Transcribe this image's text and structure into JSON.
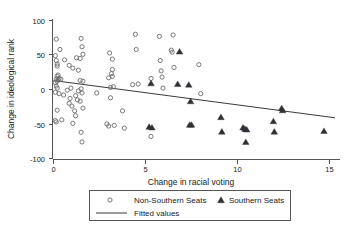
{
  "chart_data": {
    "type": "scatter",
    "title": "",
    "xlabel": "Change in racial voting",
    "ylabel": "Change in ideological rank",
    "xlim": [
      -0.6,
      15.6
    ],
    "ylim": [
      -100,
      100
    ],
    "xticks": [
      0,
      5,
      10,
      15
    ],
    "xticklabels": [
      "0",
      "5",
      "10",
      "15"
    ],
    "yticks": [
      -100,
      -50,
      0,
      50,
      100
    ],
    "yticklabels": [
      "-100",
      "-50",
      "0",
      "50",
      "100"
    ],
    "grid": false,
    "legend_position": "below-axes",
    "series": [
      {
        "name": "Non-Southern Seats",
        "marker": "open-circle",
        "color": "#6b6b6b",
        "points": [
          [
            0.15,
            73
          ],
          [
            0.1,
            49
          ],
          [
            0.35,
            58
          ],
          [
            0.15,
            42
          ],
          [
            0.2,
            37
          ],
          [
            0.2,
            34
          ],
          [
            0.6,
            43
          ],
          [
            0.25,
            21
          ],
          [
            0.2,
            19
          ],
          [
            0.3,
            16
          ],
          [
            0.15,
            15
          ],
          [
            0.25,
            14
          ],
          [
            0.2,
            12
          ],
          [
            0.4,
            15
          ],
          [
            0.1,
            10
          ],
          [
            0.15,
            5
          ],
          [
            0.2,
            2
          ],
          [
            0.1,
            -4
          ],
          [
            0.3,
            -6
          ],
          [
            0.55,
            -8
          ],
          [
            0.2,
            -30
          ],
          [
            0.1,
            -45
          ],
          [
            0.15,
            -47
          ],
          [
            0.45,
            -44
          ],
          [
            0.9,
            -13
          ],
          [
            0.85,
            -20
          ],
          [
            1.0,
            -24
          ],
          [
            1.15,
            -31
          ],
          [
            1.2,
            -38
          ],
          [
            1.05,
            -49
          ],
          [
            1.5,
            -62
          ],
          [
            1.55,
            -76
          ],
          [
            1.5,
            74
          ],
          [
            1.45,
            45
          ],
          [
            1.25,
            46
          ],
          [
            1.55,
            62
          ],
          [
            1.6,
            51
          ],
          [
            1.35,
            28
          ],
          [
            1.45,
            13
          ],
          [
            1.6,
            12
          ],
          [
            1.5,
            1
          ],
          [
            1.35,
            -2
          ],
          [
            1.55,
            -5
          ],
          [
            1.2,
            -9
          ],
          [
            1.3,
            -15
          ],
          [
            1.45,
            -17
          ],
          [
            1.6,
            -27
          ],
          [
            0.95,
            2
          ],
          [
            0.75,
            -1
          ],
          [
            0.85,
            35
          ],
          [
            1.05,
            31
          ],
          [
            2.35,
            -5
          ],
          [
            3.05,
            53
          ],
          [
            3.2,
            44
          ],
          [
            3.15,
            23
          ],
          [
            3.2,
            19
          ],
          [
            3.0,
            17
          ],
          [
            3.2,
            29
          ],
          [
            3.1,
            3
          ],
          [
            3.25,
            4
          ],
          [
            3.1,
            -12
          ],
          [
            3.0,
            -53
          ],
          [
            3.3,
            -52
          ],
          [
            3.75,
            -31
          ],
          [
            3.85,
            -56
          ],
          [
            4.45,
            80
          ],
          [
            4.5,
            58
          ],
          [
            4.3,
            7
          ],
          [
            4.6,
            8
          ],
          [
            5.3,
            16
          ],
          [
            5.3,
            -68
          ],
          [
            5.75,
            77
          ],
          [
            5.8,
            42
          ],
          [
            5.85,
            27
          ],
          [
            5.9,
            18
          ],
          [
            5.95,
            2
          ],
          [
            6.5,
            79
          ],
          [
            6.4,
            57
          ],
          [
            6.45,
            54
          ],
          [
            6.55,
            32
          ],
          [
            7.9,
            36
          ],
          [
            8.0,
            -6
          ],
          [
            2.9,
            -50
          ]
        ]
      },
      {
        "name": "Southern Seats",
        "marker": "filled-triangle",
        "color": "#2f2f35",
        "points": [
          [
            6.85,
            55
          ],
          [
            5.3,
            9
          ],
          [
            6.75,
            8
          ],
          [
            7.35,
            7
          ],
          [
            7.45,
            -17
          ],
          [
            5.2,
            -54
          ],
          [
            5.35,
            -55
          ],
          [
            7.4,
            -51
          ],
          [
            7.5,
            -51
          ],
          [
            9.1,
            -40
          ],
          [
            9.15,
            -61
          ],
          [
            10.3,
            -55
          ],
          [
            10.4,
            -57
          ],
          [
            10.5,
            -58
          ],
          [
            10.45,
            -76
          ],
          [
            11.95,
            -46
          ],
          [
            12.0,
            -61
          ],
          [
            12.4,
            -27
          ],
          [
            12.45,
            -30
          ],
          [
            14.7,
            -60
          ]
        ]
      }
    ],
    "fitted_line": {
      "name": "Fitted values",
      "x_start": 0.0,
      "y_start": 13,
      "x_end": 15.3,
      "y_end": -41
    }
  },
  "legend": {
    "entries": [
      {
        "label": "Non-Southern Seats",
        "marker": "open-circle"
      },
      {
        "label": "Southern Seats",
        "marker": "filled-triangle"
      },
      {
        "label": "Fitted values",
        "marker": "line"
      }
    ]
  },
  "axes": {
    "x_title": "Change in racial voting",
    "y_title": "Change in ideological rank"
  }
}
